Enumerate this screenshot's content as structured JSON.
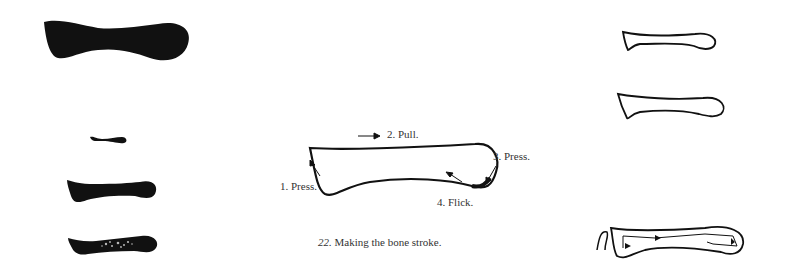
{
  "figure": {
    "number": "22.",
    "caption": "Making the bone stroke."
  },
  "diagram": {
    "steps": [
      {
        "label": "1. Press.",
        "arrow": "up-left"
      },
      {
        "label": "2. Pull.",
        "arrow": "right"
      },
      {
        "label": "3. Press.",
        "arrow": "down-left"
      },
      {
        "label": "4. Flick.",
        "arrow": "up-left"
      }
    ]
  },
  "left_column": {
    "description": "solid brush-ink bone strokes",
    "items": [
      "large bone stroke",
      "small bone stroke",
      "medium bone stroke",
      "dry-brush bone stroke"
    ]
  },
  "right_column": {
    "description": "outlined bone strokes",
    "items": [
      "outline bone stroke 1",
      "outline bone stroke 2",
      "outline bone stroke with direction arrows"
    ]
  },
  "colors": {
    "ink": "#111111",
    "background": "#ffffff"
  }
}
